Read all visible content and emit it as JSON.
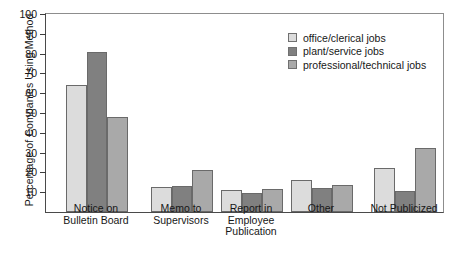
{
  "chart_data": {
    "type": "bar",
    "title": "",
    "xlabel": "",
    "ylabel": "Percentage of Companies Using Method",
    "ylim": [
      0,
      100
    ],
    "yticks": [
      10,
      20,
      30,
      40,
      50,
      60,
      70,
      80,
      90,
      100
    ],
    "grid": false,
    "legend_position": "top-right",
    "categories": [
      "Notice on\nBulletin Board",
      "Memo to\nSupervisors",
      "Report in\nEmployee\nPublication",
      "Other",
      "Not Publicized"
    ],
    "category_lines": [
      [
        "Notice on",
        "Bulletin Board"
      ],
      [
        "Memo to",
        "Supervisors"
      ],
      [
        "Report in",
        "Employee",
        "Publication"
      ],
      [
        "Other"
      ],
      [
        "Not Publicized"
      ]
    ],
    "series": [
      {
        "name": "office/clerical jobs",
        "color": "#dcdcdc",
        "values": [
          64,
          12.5,
          11,
          16,
          22
        ]
      },
      {
        "name": "plant/service jobs",
        "color": "#808080",
        "values": [
          81,
          13,
          9.5,
          12,
          10.5
        ]
      },
      {
        "name": "professional/technical jobs",
        "color": "#a9a9a9",
        "values": [
          48,
          21,
          11.5,
          13.5,
          32.5
        ]
      }
    ]
  }
}
